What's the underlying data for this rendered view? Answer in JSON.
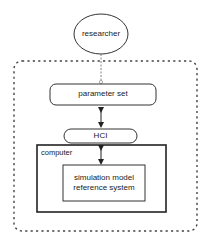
{
  "diagram": {
    "nodes": {
      "researcher": {
        "label": "researcher",
        "shape": "ellipse"
      },
      "parameter_set": {
        "label": "parameter set",
        "shape": "rounded-rect"
      },
      "hci": {
        "label": "HCI",
        "shape": "pill"
      },
      "computer": {
        "label": "computer",
        "shape": "rect-container"
      },
      "simulation": {
        "line1": "simulation model",
        "line2": "reference system",
        "shape": "rect"
      }
    },
    "edges": [
      {
        "from": "researcher",
        "to": "parameter_set",
        "style": "dashed"
      },
      {
        "from": "parameter_set",
        "to": "hci",
        "style": "double-arrow"
      },
      {
        "from": "hci",
        "to": "simulation",
        "style": "double-arrow"
      }
    ],
    "boundary": {
      "style": "dotted-rounded"
    },
    "colors": {
      "stroke": "#333333",
      "background": "#ffffff",
      "dotted": "#444444"
    }
  }
}
